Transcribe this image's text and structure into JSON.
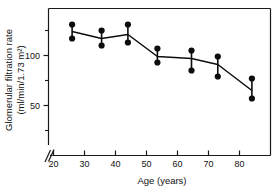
{
  "chart_data": {
    "type": "scatter",
    "title": "",
    "xlabel": "Age (years)",
    "ylabel": "Glomerular filtration rate (ml/min/1.73 m²)",
    "ylabel_line1": "Glomerular filtration rate",
    "ylabel_line2": "(ml/min/1.73 m²)",
    "xlim": [
      18,
      90
    ],
    "ylim": [
      20,
      140
    ],
    "xticks": [
      20,
      30,
      40,
      50,
      60,
      70,
      80
    ],
    "xticklabels": [
      "20",
      "30",
      "40",
      "50",
      "60",
      "70",
      "80"
    ],
    "yticks": [
      50,
      100
    ],
    "yticklabels": [
      "50",
      "100"
    ],
    "yticks_minor": [
      25,
      75,
      125
    ],
    "grid": false,
    "legend": null,
    "axis_break": "x-axis broken near origin",
    "x": [
      26,
      35.5,
      44,
      53.5,
      64.5,
      73,
      84
    ],
    "values": [
      124,
      117,
      121,
      99,
      97,
      91,
      65
    ],
    "upper": [
      131,
      125,
      131,
      107,
      105,
      99,
      77
    ],
    "lower": [
      117,
      110,
      113,
      93,
      85,
      79,
      57
    ],
    "series": [
      {
        "name": "Glomerular filtration rate",
        "values": [
          124,
          117,
          121,
          99,
          97,
          91,
          65
        ]
      }
    ],
    "points": [
      {
        "age": 26,
        "mean": 124,
        "upper": 131,
        "lower": 117
      },
      {
        "age": 35.5,
        "mean": 117,
        "upper": 125,
        "lower": 110
      },
      {
        "age": 44,
        "mean": 121,
        "upper": 131,
        "lower": 113
      },
      {
        "age": 53.5,
        "mean": 99,
        "upper": 107,
        "lower": 93
      },
      {
        "age": 64.5,
        "mean": 97,
        "upper": 105,
        "lower": 85
      },
      {
        "age": 73,
        "mean": 91,
        "upper": 99,
        "lower": 79
      },
      {
        "age": 84,
        "mean": 65,
        "upper": 77,
        "lower": 57
      }
    ],
    "colors": {
      "marker": "#0d0d0d",
      "line": "#0d0d0d",
      "axis": "#1a1a1a",
      "background": "#ffffff"
    }
  }
}
